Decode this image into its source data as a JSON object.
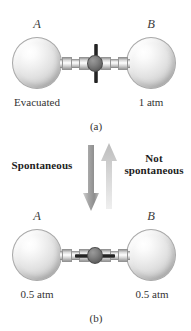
{
  "figure": {
    "panels": [
      {
        "id": "a",
        "caption": "(a)",
        "valve_state": "closed",
        "vessels": [
          {
            "letter": "A",
            "condition": "Evacuated"
          },
          {
            "letter": "B",
            "condition": "1 atm"
          }
        ]
      },
      {
        "id": "b",
        "caption": "(b)",
        "valve_state": "open",
        "vessels": [
          {
            "letter": "A",
            "condition": "0.5 atm"
          },
          {
            "letter": "B",
            "condition": "0.5 atm"
          }
        ]
      }
    ],
    "process_arrows": {
      "downward": {
        "label": "Spontaneous",
        "direction": "down",
        "color": "#9a9a9a"
      },
      "upward": {
        "label_line1": "Not",
        "label_line2": "spontaneous",
        "direction": "up",
        "color": "#c6c6c6"
      }
    },
    "colors": {
      "flask_highlight": "#ffffff",
      "flask_shade": "#9b9b9b",
      "valve_body": "#6b6b6b",
      "valve_handle": "#1e1e1e",
      "text": "#333333",
      "background": "#ffffff"
    }
  }
}
